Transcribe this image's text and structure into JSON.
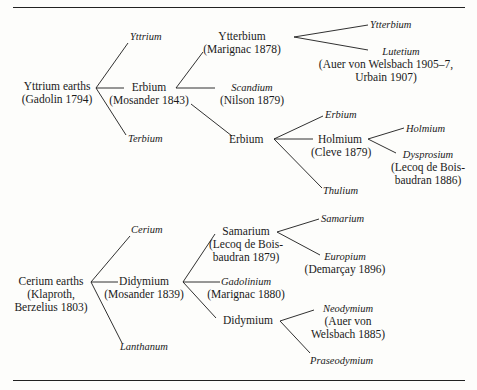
{
  "yttrium_tree": {
    "root": {
      "name": "Yttrium earths",
      "credit": "(Gadolin 1794)"
    },
    "yttrium": "Yttrium",
    "erbium": {
      "name": "Erbium",
      "credit": "(Mosander 1843)"
    },
    "terbium": "Terbium",
    "ytterbium": {
      "name": "Ytterbium",
      "credit": "(Marignac 1878)"
    },
    "scandium": {
      "name": "Scandium",
      "credit": "(Nilson 1879)"
    },
    "erbium2": {
      "name": "Erbium"
    },
    "ytterbium_final": "Ytterbium",
    "lutetium": {
      "name": "Lutetium",
      "credit_line1": "(Auer von Welsbach 1905–7,",
      "credit_line2": "Urbain 1907)"
    },
    "erbium_final": "Erbium",
    "holmium": {
      "name": "Holmium",
      "credit": "(Cleve 1879)"
    },
    "thulium": "Thulium",
    "holmium_final": "Holmium",
    "dysprosium": {
      "name": "Dysprosium",
      "credit_line1": "(Lecoq de Bois-",
      "credit_line2": "baudran 1886)"
    }
  },
  "cerium_tree": {
    "root": {
      "name": "Cerium earths",
      "credit_line1": "(Klaproth,",
      "credit_line2": "Berzelius 1803)"
    },
    "cerium": "Cerium",
    "didymium": {
      "name": "Didymium",
      "credit": "(Mosander 1839)"
    },
    "lanthanum": "Lanthanum",
    "samarium": {
      "name": "Samarium",
      "credit_line1": "(Lecoq de Bois-",
      "credit_line2": "baudran 1879)"
    },
    "gadolinium": {
      "name": "Gadolinium",
      "credit": "(Marignac 1880)"
    },
    "didymium2": {
      "name": "Didymium"
    },
    "samarium_final": "Samarium",
    "europium": {
      "name": "Europium",
      "credit": "(Demarçay 1896)"
    },
    "neodymium": {
      "name": "Neodymium",
      "credit_line1": "(Auer von",
      "credit_line2": "Welsbach 1885)"
    },
    "praseodymium": "Praseodymium"
  }
}
